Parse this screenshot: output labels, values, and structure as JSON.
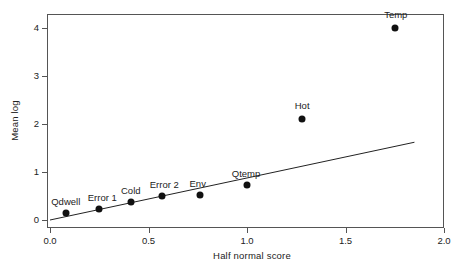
{
  "chart_data": {
    "type": "scatter",
    "title": "",
    "xlabel": "Half normal score",
    "ylabel": "Mean log",
    "xlim": [
      0.0,
      2.0
    ],
    "ylim": [
      0.0,
      4.35
    ],
    "xticks": [
      "0.0",
      "0.5",
      "1.0",
      "1.5",
      "2.0"
    ],
    "xtick_values": [
      0.0,
      0.5,
      1.0,
      1.5,
      2.0
    ],
    "yticks": [
      "0",
      "1",
      "2",
      "3",
      "4"
    ],
    "ytick_values": [
      0,
      1,
      2,
      3,
      4
    ],
    "grid": false,
    "legend": "none",
    "points": [
      {
        "label": "Qdwell",
        "x": 0.08,
        "y": 0.15,
        "label_dx": 0,
        "label_dy": -7
      },
      {
        "label": "Error 1",
        "x": 0.25,
        "y": 0.22,
        "label_dx": 3,
        "label_dy": -7
      },
      {
        "label": "Cold",
        "x": 0.41,
        "y": 0.37,
        "label_dx": 0,
        "label_dy": -7
      },
      {
        "label": "Error 2",
        "x": 0.57,
        "y": 0.49,
        "label_dx": 2,
        "label_dy": -7
      },
      {
        "label": "Env",
        "x": 0.76,
        "y": 0.53,
        "label_dx": -2,
        "label_dy": -7
      },
      {
        "label": "Qtemp",
        "x": 1.0,
        "y": 0.73,
        "label_dx": -1,
        "label_dy": -7
      },
      {
        "label": "Hot",
        "x": 1.28,
        "y": 2.1,
        "label_dx": 0,
        "label_dy": -9
      },
      {
        "label": "Temp",
        "x": 1.75,
        "y": 4.0,
        "label_dx": 1,
        "label_dy": -9
      }
    ],
    "fit_line": {
      "name": "reference line",
      "x0": 0.0,
      "y0": 0.0,
      "x1": 1.85,
      "y1": 1.62
    },
    "colors": {
      "marker": "#111111",
      "line": "#222222",
      "axis": "#555555",
      "text": "#222222",
      "background": "#ffffff"
    }
  }
}
